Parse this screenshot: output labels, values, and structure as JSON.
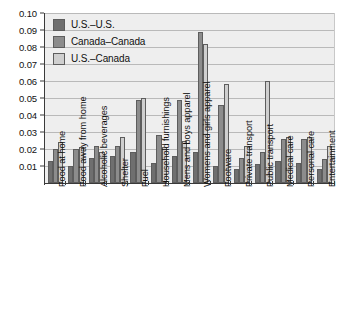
{
  "chart_data": {
    "type": "bar",
    "title": "",
    "xlabel": "",
    "ylabel": "",
    "ylim": [
      0,
      0.1
    ],
    "ytick_labels": [
      "0.10",
      "0.09",
      "0.08",
      "0.07",
      "0.06",
      "0.05",
      "0.04",
      "0.03",
      "0.02",
      "0.01"
    ],
    "ytick_values": [
      0.1,
      0.09,
      0.08,
      0.07,
      0.06,
      0.05,
      0.04,
      0.03,
      0.02,
      0.01
    ],
    "grid": true,
    "legend_position": "top-left",
    "categories": [
      "Food at home",
      "Food away from home",
      "Alcoholic beverages",
      "Shelter",
      "Fuel",
      "Household furnishings",
      "Mens and boys apparel",
      "Womens and girls apparel",
      "Footware",
      "Private transport",
      "Public transport",
      "Medical care",
      "Personal care",
      "Entertainment"
    ],
    "series": [
      {
        "name": "U.S.–U.S.",
        "color": "#6f6f6f",
        "values": [
          0.013,
          0.01,
          0.015,
          0.016,
          0.018,
          0.012,
          0.016,
          0.018,
          0.01,
          0.008,
          0.011,
          0.013,
          0.012,
          0.008
        ]
      },
      {
        "name": "Canada–Canada",
        "color": "#8c8c8c",
        "values": [
          0.02,
          0.02,
          0.022,
          0.022,
          0.049,
          0.028,
          0.049,
          0.089,
          0.046,
          0.015,
          0.018,
          0.026,
          0.026,
          0.014
        ]
      },
      {
        "name": "U.S.–Canada",
        "color": "#cfcfcf",
        "values": [
          0.024,
          0.021,
          0.018,
          0.027,
          0.05,
          0.021,
          0.025,
          0.082,
          0.058,
          0.022,
          0.06,
          0.027,
          0.027,
          0.022
        ]
      }
    ]
  },
  "legend": {
    "items": [
      {
        "label": "U.S.–U.S."
      },
      {
        "label": "Canada–Canada"
      },
      {
        "label": "U.S.–Canada"
      }
    ]
  }
}
